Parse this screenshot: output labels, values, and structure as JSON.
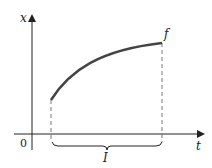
{
  "diagram": {
    "axes": {
      "vertical_label": "x",
      "horizontal_label": "t",
      "origin_label": "0"
    },
    "curve_label": "f",
    "interval_label": "I",
    "colors": {
      "axis": "#222222",
      "curve": "#444444",
      "dashed": "#555555"
    }
  }
}
